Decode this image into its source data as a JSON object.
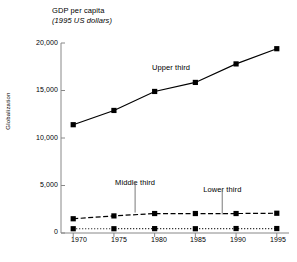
{
  "chart_data": {
    "type": "line",
    "title": "GDP per capita",
    "subtitle": "(1995 US dollars)",
    "ylabel": "Globalization",
    "xlabel": "",
    "x": [
      1970,
      1975,
      1980,
      1985,
      1990,
      1995
    ],
    "xtick_labels": [
      "1970",
      "1975",
      "1980",
      "1985",
      "1990",
      "1995"
    ],
    "ytick_labels": [
      "0",
      "5,000",
      "10,000",
      "15,000",
      "20,000"
    ],
    "ytick_values": [
      0,
      5000,
      10000,
      15000,
      20000
    ],
    "ylim": [
      0,
      20000
    ],
    "xlim": [
      1968.5,
      1996.5
    ],
    "grid": false,
    "legend_position": "inline-annotations",
    "series": [
      {
        "name": "Upper third",
        "values": [
          11400,
          12900,
          14900,
          15850,
          17800,
          19400
        ],
        "line_style": "solid",
        "marker": "square",
        "color": "#000000",
        "label_x": 1982.0,
        "label_y": 16700
      },
      {
        "name": "Middle third",
        "values": [
          1500,
          1800,
          2050,
          2050,
          2050,
          2080
        ],
        "line_style": "dashed",
        "marker": "square",
        "color": "#000000",
        "label_x": 1977.6,
        "label_y": 4650,
        "leader_to_y": 2150
      },
      {
        "name": "Lower third",
        "values": [
          450,
          450,
          460,
          450,
          470,
          470
        ],
        "line_style": "dotted",
        "marker": "square",
        "color": "#000000",
        "label_x": 1988.3,
        "label_y": 3900,
        "leader_to_y": 1950
      }
    ]
  }
}
